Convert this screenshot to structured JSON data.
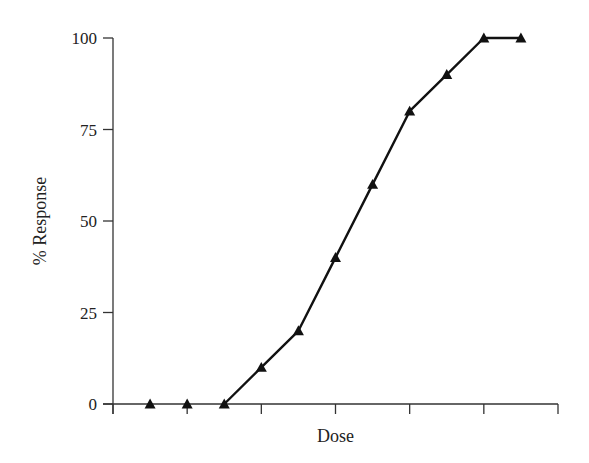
{
  "chart_data": {
    "type": "line",
    "title": "",
    "xlabel": "Dose",
    "ylabel": "% Response",
    "xlim": [
      0,
      6
    ],
    "ylim": [
      0,
      100
    ],
    "x_ticks": [
      0,
      1,
      2,
      3,
      4,
      5,
      6
    ],
    "x_tick_labels": [
      "",
      "",
      "",
      "",
      "",
      "",
      ""
    ],
    "y_ticks": [
      0,
      25,
      50,
      75,
      100
    ],
    "y_tick_labels": [
      "0",
      "25",
      "50",
      "75",
      "100"
    ],
    "grid": false,
    "legend": null,
    "series": [
      {
        "name": "Response",
        "marker": "triangle",
        "x": [
          0.5,
          1.0,
          1.5,
          2.0,
          2.5,
          3.0,
          3.5,
          4.0,
          4.5,
          5.0,
          5.5
        ],
        "values": [
          0,
          0,
          0,
          10,
          20,
          40,
          60,
          80,
          90,
          100,
          100
        ]
      }
    ],
    "line_starts_at_index": 2
  }
}
